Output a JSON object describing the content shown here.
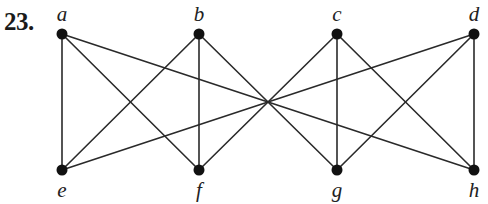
{
  "problem": {
    "number": "23."
  },
  "chart_data": {
    "type": "graph",
    "directed": false,
    "vertices": [
      {
        "id": "a",
        "label": "a",
        "x": 62,
        "y": 34,
        "label_pos": "above"
      },
      {
        "id": "b",
        "label": "b",
        "x": 199,
        "y": 34,
        "label_pos": "above"
      },
      {
        "id": "c",
        "label": "c",
        "x": 337,
        "y": 34,
        "label_pos": "above"
      },
      {
        "id": "d",
        "label": "d",
        "x": 474,
        "y": 34,
        "label_pos": "above"
      },
      {
        "id": "e",
        "label": "e",
        "x": 62,
        "y": 170,
        "label_pos": "below"
      },
      {
        "id": "f",
        "label": "f",
        "x": 199,
        "y": 170,
        "label_pos": "below"
      },
      {
        "id": "g",
        "label": "g",
        "x": 337,
        "y": 170,
        "label_pos": "below"
      },
      {
        "id": "h",
        "label": "h",
        "x": 474,
        "y": 170,
        "label_pos": "below"
      }
    ],
    "edges": [
      [
        "a",
        "e"
      ],
      [
        "a",
        "f"
      ],
      [
        "a",
        "h"
      ],
      [
        "b",
        "e"
      ],
      [
        "b",
        "f"
      ],
      [
        "b",
        "g"
      ],
      [
        "c",
        "f"
      ],
      [
        "c",
        "g"
      ],
      [
        "c",
        "h"
      ],
      [
        "d",
        "e"
      ],
      [
        "d",
        "g"
      ],
      [
        "d",
        "h"
      ]
    ],
    "colors": {
      "edge": "#2a2a2a",
      "vertex": "#111111",
      "label": "#222222"
    }
  }
}
